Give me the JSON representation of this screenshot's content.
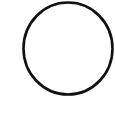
{
  "shape": {
    "type": "circle",
    "cx": 68,
    "cy": 48.5,
    "rx": 44.5,
    "ry": 46,
    "stroke": "#111111",
    "stroke_width": 2.6,
    "fill": "none"
  },
  "background": "#ffffff"
}
